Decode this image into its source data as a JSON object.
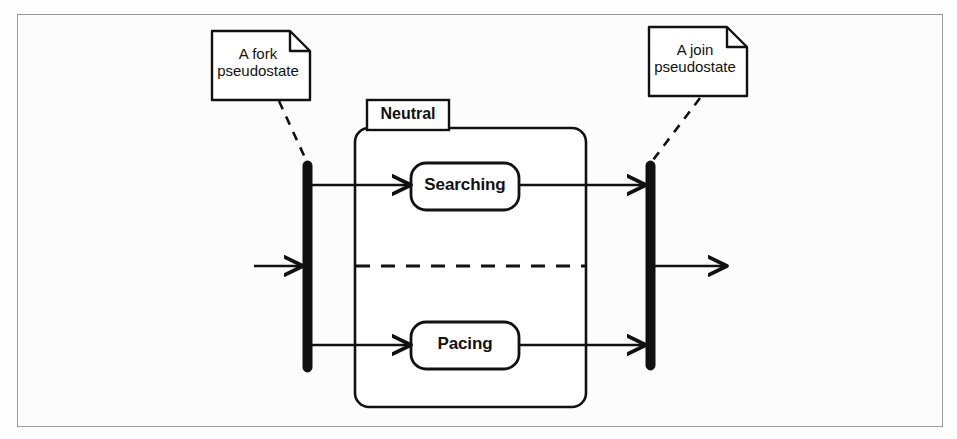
{
  "diagram": {
    "type": "uml-state-machine-diagram",
    "frame": {
      "border_color": "#9a9a9a",
      "background": "#fcfcfc"
    },
    "stroke_color": "#111111",
    "notes": [
      {
        "id": "fork-note",
        "text": "A fork\npseudostate",
        "line1": "A fork",
        "line2": "pseudostate",
        "anchor": "fork-bar"
      },
      {
        "id": "join-note",
        "text": "A join\npseudostate",
        "line1": "A join",
        "line2": "pseudostate",
        "anchor": "join-bar"
      }
    ],
    "composite_state": {
      "name": "Neutral",
      "regions": 2,
      "divider": "dashed"
    },
    "states": [
      {
        "id": "searching-state",
        "name": "Searching",
        "region": 1
      },
      {
        "id": "pacing-state",
        "name": "Pacing",
        "region": 2
      }
    ],
    "pseudostates": [
      {
        "id": "fork-bar",
        "kind": "fork",
        "orientation": "vertical"
      },
      {
        "id": "join-bar",
        "kind": "join",
        "orientation": "vertical"
      }
    ],
    "transitions": [
      {
        "id": "entry-transition",
        "from": "",
        "to": "fork-bar",
        "label": ""
      },
      {
        "id": "fork-to-searching",
        "from": "fork-bar",
        "to": "searching-state",
        "label": ""
      },
      {
        "id": "fork-to-pacing",
        "from": "fork-bar",
        "to": "pacing-state",
        "label": ""
      },
      {
        "id": "searching-to-join",
        "from": "searching-state",
        "to": "join-bar",
        "label": ""
      },
      {
        "id": "pacing-to-join",
        "from": "pacing-state",
        "to": "join-bar",
        "label": ""
      },
      {
        "id": "exit-transition",
        "from": "join-bar",
        "to": "",
        "label": ""
      }
    ]
  }
}
